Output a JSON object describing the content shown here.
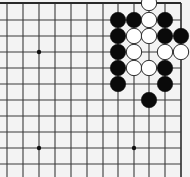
{
  "board": {
    "background": "#f3f3f3",
    "line_color": "#3a3a3a",
    "edge_color": "#2a2a2a",
    "x_lines": [
      7,
      23,
      39,
      55,
      71,
      87,
      103,
      118,
      134,
      149,
      165,
      181
    ],
    "y_lines": [
      3,
      20,
      36,
      52,
      68,
      84,
      100,
      116,
      132,
      148,
      164
    ],
    "top_edge": true,
    "right_edge": true,
    "stone_radius": 8,
    "star_points": [
      {
        "col": 2,
        "row": 3
      },
      {
        "col": 2,
        "row": 9
      },
      {
        "col": 8,
        "row": 9
      }
    ],
    "stones": [
      {
        "color": "white",
        "col": 9,
        "row": 0
      },
      {
        "color": "black",
        "col": 7,
        "row": 1
      },
      {
        "color": "black",
        "col": 8,
        "row": 1
      },
      {
        "color": "white",
        "col": 9,
        "row": 1
      },
      {
        "color": "black",
        "col": 10,
        "row": 1
      },
      {
        "color": "black",
        "col": 7,
        "row": 2
      },
      {
        "color": "white",
        "col": 8,
        "row": 2
      },
      {
        "color": "white",
        "col": 9,
        "row": 2
      },
      {
        "color": "black",
        "col": 10,
        "row": 2
      },
      {
        "color": "black",
        "col": 11,
        "row": 2
      },
      {
        "color": "black",
        "col": 7,
        "row": 3
      },
      {
        "color": "white",
        "col": 8,
        "row": 3
      },
      {
        "color": "white",
        "col": 10,
        "row": 3
      },
      {
        "color": "white",
        "col": 11,
        "row": 3
      },
      {
        "color": "black",
        "col": 7,
        "row": 4
      },
      {
        "color": "white",
        "col": 8,
        "row": 4
      },
      {
        "color": "white",
        "col": 9,
        "row": 4
      },
      {
        "color": "black",
        "col": 10,
        "row": 4
      },
      {
        "color": "black",
        "col": 7,
        "row": 5
      },
      {
        "color": "black",
        "col": 10,
        "row": 5
      },
      {
        "color": "black",
        "col": 9,
        "row": 6
      }
    ]
  }
}
